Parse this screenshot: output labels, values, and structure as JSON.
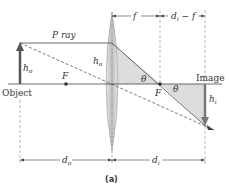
{
  "figure": {
    "caption": "(a)",
    "labels": {
      "p_ray": "P ray",
      "object": "Object",
      "image": "Image",
      "f_left": "F",
      "f_right": "F",
      "h_o_object": "h",
      "h_o_object_sub": "o",
      "h_o_lens": "h",
      "h_o_lens_sub": "o",
      "h_i": "h",
      "h_i_sub": "i",
      "theta_1": "θ",
      "theta_2": "θ",
      "dim_f": "f",
      "dim_di_minus_f": "d",
      "dim_di_minus_f_sub": "i",
      "dim_di_minus_f_rest": " − f",
      "dim_do": "d",
      "dim_do_sub": "o",
      "dim_di": "d",
      "dim_di_sub": "i"
    },
    "colors": {
      "object_arrow": "#555555",
      "image_arrow": "#777777",
      "triangle_fill": "#d9d9d9",
      "lens_fill": "#cfcfcf",
      "line": "#444444"
    }
  }
}
